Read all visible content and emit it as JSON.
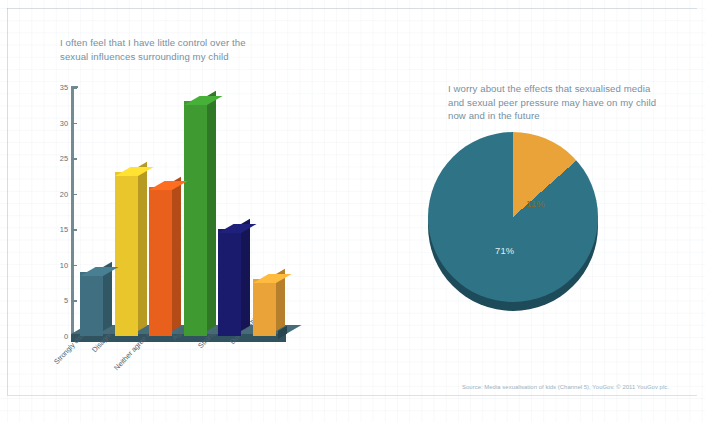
{
  "page": {
    "background_color": "#ffffff",
    "grid_color": "#96aab9"
  },
  "bar_chart": {
    "title": "I often feel that I have little control over the\nsexual influences surrounding my child",
    "title_color": "#77909f",
    "y_ticks": [
      "0",
      "5",
      "10",
      "15",
      "20",
      "25",
      "30",
      "35"
    ],
    "categories": [
      "Strongly disagree",
      "Disagree",
      "Neither agree nor disagree",
      "Agree",
      "Strongly agree",
      "Don't know"
    ],
    "values": [
      9,
      23,
      21,
      33,
      15,
      8
    ],
    "colors": [
      "#3f6f81",
      "#e9c62c",
      "#e8601c",
      "#3e9a31",
      "#1b1b6d",
      "#e9a338"
    ]
  },
  "pie_chart": {
    "title": "I worry about the effects that sexualised media\nand sexual peer pressure may have on my child\nnow and in the future",
    "title_color": "#77909f",
    "slices": [
      {
        "label": "11%",
        "value": 11,
        "color": "#e9a338"
      },
      {
        "label": "71%",
        "value": 71,
        "color": "#2e7486"
      }
    ],
    "label_amber": "11%",
    "label_teal": "71%"
  },
  "source": {
    "text": "Source: Media sexualisation of kids (Channel 5), YouGov. © 2011 YouGov plc."
  },
  "chart_data": [
    {
      "type": "bar",
      "title": "I often feel that I have little control over the sexual influences surrounding my child",
      "categories": [
        "Strongly disagree",
        "Disagree",
        "Neither agree nor disagree",
        "Agree",
        "Strongly agree",
        "Don't know"
      ],
      "values": [
        9,
        23,
        21,
        33,
        15,
        8
      ],
      "xlabel": "",
      "ylabel": "",
      "ylim": [
        0,
        35
      ],
      "yticks": [
        0,
        5,
        10,
        15,
        20,
        25,
        30,
        35
      ],
      "grid": true,
      "legend": "none",
      "series_colors": [
        "#3f6f81",
        "#e9c62c",
        "#e8601c",
        "#3e9a31",
        "#1b1b6d",
        "#e9a338"
      ]
    },
    {
      "type": "pie",
      "title": "I worry about the effects that sexualised media and sexual peer pressure may have on my child now and in the future",
      "categories": [
        "11%",
        "71%"
      ],
      "values": [
        11,
        71
      ],
      "labels": [
        "11%",
        "71%"
      ],
      "colors": [
        "#e9a338",
        "#2e7486"
      ],
      "legend": "none",
      "start_angle_deg": 90,
      "direction": "clockwise"
    }
  ]
}
